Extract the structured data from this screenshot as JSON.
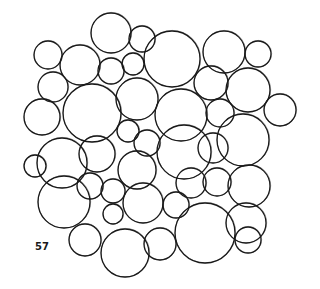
{
  "figure": {
    "number": "57",
    "stroke_color": "#1a1a1a",
    "background": "#ffffff",
    "bubbles": [
      {
        "cx": 111,
        "cy": 33,
        "r": 20
      },
      {
        "cx": 142,
        "cy": 39,
        "r": 13
      },
      {
        "cx": 172,
        "cy": 59,
        "r": 28
      },
      {
        "cx": 224,
        "cy": 52,
        "r": 21
      },
      {
        "cx": 258,
        "cy": 54,
        "r": 13
      },
      {
        "cx": 48,
        "cy": 55,
        "r": 14
      },
      {
        "cx": 80,
        "cy": 65,
        "r": 20
      },
      {
        "cx": 111,
        "cy": 71,
        "r": 13
      },
      {
        "cx": 133,
        "cy": 64,
        "r": 11
      },
      {
        "cx": 53,
        "cy": 87,
        "r": 15
      },
      {
        "cx": 92,
        "cy": 113,
        "r": 29
      },
      {
        "cx": 137,
        "cy": 99,
        "r": 21
      },
      {
        "cx": 181,
        "cy": 115,
        "r": 26
      },
      {
        "cx": 211,
        "cy": 83,
        "r": 17
      },
      {
        "cx": 248,
        "cy": 90,
        "r": 22
      },
      {
        "cx": 280,
        "cy": 110,
        "r": 16
      },
      {
        "cx": 42,
        "cy": 117,
        "r": 18
      },
      {
        "cx": 220,
        "cy": 113,
        "r": 14
      },
      {
        "cx": 243,
        "cy": 140,
        "r": 26
      },
      {
        "cx": 128,
        "cy": 131,
        "r": 11
      },
      {
        "cx": 147,
        "cy": 143,
        "r": 13
      },
      {
        "cx": 184,
        "cy": 152,
        "r": 27
      },
      {
        "cx": 213,
        "cy": 148,
        "r": 15
      },
      {
        "cx": 97,
        "cy": 154,
        "r": 18
      },
      {
        "cx": 62,
        "cy": 163,
        "r": 25
      },
      {
        "cx": 35,
        "cy": 166,
        "r": 11
      },
      {
        "cx": 137,
        "cy": 170,
        "r": 19
      },
      {
        "cx": 191,
        "cy": 183,
        "r": 15
      },
      {
        "cx": 217,
        "cy": 182,
        "r": 14
      },
      {
        "cx": 249,
        "cy": 186,
        "r": 21
      },
      {
        "cx": 90,
        "cy": 186,
        "r": 13
      },
      {
        "cx": 113,
        "cy": 191,
        "r": 12
      },
      {
        "cx": 113,
        "cy": 214,
        "r": 10
      },
      {
        "cx": 64,
        "cy": 202,
        "r": 26
      },
      {
        "cx": 143,
        "cy": 203,
        "r": 20
      },
      {
        "cx": 176,
        "cy": 205,
        "r": 13
      },
      {
        "cx": 205,
        "cy": 233,
        "r": 30
      },
      {
        "cx": 246,
        "cy": 223,
        "r": 20
      },
      {
        "cx": 85,
        "cy": 240,
        "r": 16
      },
      {
        "cx": 125,
        "cy": 253,
        "r": 24
      },
      {
        "cx": 160,
        "cy": 244,
        "r": 16
      },
      {
        "cx": 248,
        "cy": 240,
        "r": 13
      }
    ]
  }
}
